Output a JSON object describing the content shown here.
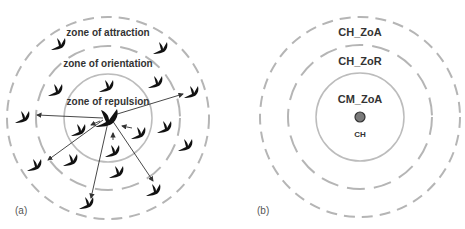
{
  "panel_a": {
    "label": "(a)",
    "zones": {
      "attraction": "zone of attraction",
      "orientation": "zone of orientation",
      "repulsion": "zone of repulsion"
    },
    "center": [
      108,
      118
    ],
    "radii": {
      "attraction": 101,
      "orientation": 72,
      "repulsion": 44
    },
    "focal_bird": [
      108,
      116
    ],
    "birds": [
      [
        60,
        44
      ],
      [
        162,
        48
      ],
      [
        57,
        90
      ],
      [
        108,
        86
      ],
      [
        157,
        82
      ],
      [
        24,
        117
      ],
      [
        80,
        130
      ],
      [
        140,
        133
      ],
      [
        166,
        127
      ],
      [
        193,
        92
      ],
      [
        114,
        151
      ],
      [
        36,
        165
      ],
      [
        72,
        160
      ],
      [
        118,
        172
      ],
      [
        187,
        145
      ],
      [
        155,
        190
      ],
      [
        88,
        203
      ]
    ],
    "arrows": [
      [
        103,
        118,
        37,
        115
      ],
      [
        103,
        120,
        48,
        160
      ],
      [
        100,
        121,
        91,
        125
      ],
      [
        108,
        122,
        91,
        198
      ],
      [
        112,
        120,
        153,
        181
      ],
      [
        114,
        115,
        183,
        94
      ],
      [
        113,
        140,
        113,
        133
      ],
      [
        132,
        128,
        122,
        126
      ]
    ]
  },
  "panel_b": {
    "label": "(b)",
    "zones": {
      "outer": "CH_ZoA",
      "middle": "CH_ZoR",
      "inner": "CM_ZoA"
    },
    "center_label": "CH",
    "center": [
      360,
      117
    ],
    "radii": {
      "outer": 100,
      "middle": 72,
      "inner": 44
    },
    "node_color": "#7a7a7a"
  },
  "colors": {
    "dashed_circle": "#b5b5b5",
    "solid_circle": "#bcbcbc",
    "bird": "#111111",
    "arrow": "#333333",
    "text": "#333333"
  }
}
